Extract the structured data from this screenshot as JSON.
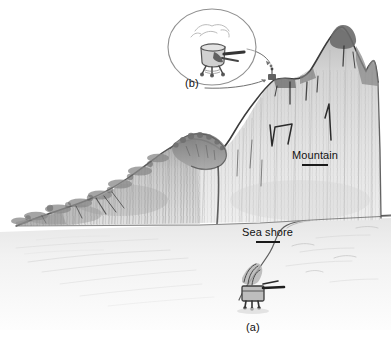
{
  "figure": {
    "style": "pencil-sketch",
    "background_color": "#ffffff",
    "ink_color": "#3a3a3a",
    "label_color": "#111111",
    "rock_light": "#e8e8e8",
    "rock_mid": "#c9c9c9",
    "rock_dark": "#8b8b8b",
    "vegetation_dark": "#6f6f6f",
    "water_tint": "#f2f2f2"
  },
  "labels": {
    "mountain": "Mountain",
    "sea_shore": "Sea shore",
    "panel_a": "(a)",
    "panel_b": "(b)"
  },
  "callout": {
    "shape": "ellipse",
    "contents": "magnified sketch of instrument on mountain ridge",
    "leader_target": "mountain ridge notch"
  },
  "objects": {
    "beach_unit": "vehicle with antenna on sea shore",
    "ridge_unit": "instrument installed on mountain ridge"
  }
}
